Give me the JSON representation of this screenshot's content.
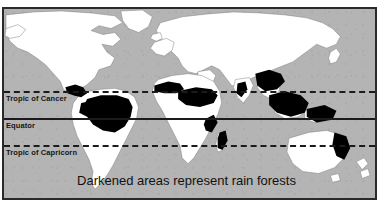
{
  "figure": {
    "caption": "Darkened areas represent rain forests",
    "projection": "equirectangular world map",
    "background_color": "#b4b4b4",
    "land_color": "#ffffff",
    "rainforest_color": "#000000",
    "frame_color": "#2a2a2a"
  },
  "latitude_lines": [
    {
      "id": "tropic-of-cancer",
      "label": "Tropic of Cancer",
      "style": "dashed",
      "degrees": 23.5
    },
    {
      "id": "equator",
      "label": "Equator",
      "style": "solid",
      "degrees": 0
    },
    {
      "id": "tropic-of-capricorn",
      "label": "Tropic of Capricorn",
      "style": "dashed",
      "degrees": -23.5
    }
  ],
  "landmasses": [
    {
      "name": "north-america"
    },
    {
      "name": "south-america"
    },
    {
      "name": "eurasia"
    },
    {
      "name": "africa"
    },
    {
      "name": "australia"
    },
    {
      "name": "greenland"
    },
    {
      "name": "southeast-asia-islands"
    },
    {
      "name": "new-zealand"
    },
    {
      "name": "madagascar"
    },
    {
      "name": "japan"
    },
    {
      "name": "british-isles"
    }
  ],
  "rainforest_regions": [
    {
      "name": "amazon-basin"
    },
    {
      "name": "central-america"
    },
    {
      "name": "congo-basin"
    },
    {
      "name": "west-africa-coast"
    },
    {
      "name": "east-africa-coast"
    },
    {
      "name": "madagascar-forest"
    },
    {
      "name": "india-western-ghats"
    },
    {
      "name": "southeast-asia-mainland"
    },
    {
      "name": "indonesia-borneo"
    },
    {
      "name": "new-guinea"
    },
    {
      "name": "northeast-australia"
    }
  ]
}
